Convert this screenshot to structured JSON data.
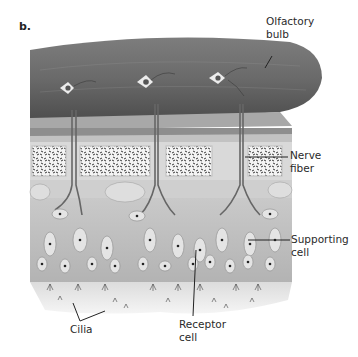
{
  "figure": {
    "panel_letter": "b.",
    "colors": {
      "bulb_dark": "#5a5a5a",
      "bulb_light": "#8c8c8c",
      "bone_fill": "#f2f2f2",
      "epithelium": "#b9b9b9",
      "mucus": "#e6e6e6",
      "label_text": "#2a2a2a"
    }
  },
  "labels": {
    "olfactory_bulb": {
      "line1": "Olfactory",
      "line2": "bulb"
    },
    "nerve_fiber": {
      "line1": "Nerve",
      "line2": "fiber"
    },
    "supporting_cell": {
      "line1": "Supporting",
      "line2": "cell"
    },
    "receptor_cell": {
      "line1": "Receptor",
      "line2": "cell"
    },
    "cilia": {
      "line1": "Cilia"
    }
  }
}
